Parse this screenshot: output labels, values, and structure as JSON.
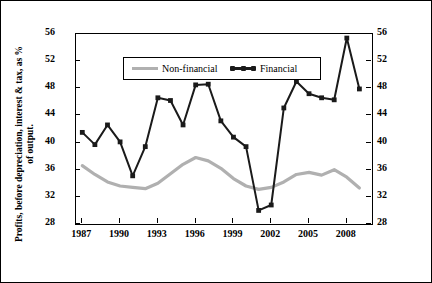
{
  "chart_data": {
    "type": "line",
    "title": "",
    "xlabel": "",
    "ylabel": "Profits, before depreciation, interest & tax, as % of output.",
    "ylim": [
      28,
      56
    ],
    "yticks": [
      28,
      32,
      36,
      40,
      44,
      48,
      52,
      56
    ],
    "xlim": [
      1986.5,
      2010.0
    ],
    "xticks": [
      1987,
      1990,
      1993,
      1996,
      1999,
      2002,
      2005,
      2008
    ],
    "grid": false,
    "legend_position": "top-center",
    "x": [
      1987,
      1988,
      1989,
      1990,
      1991,
      1992,
      1993,
      1994,
      1995,
      1996,
      1997,
      1998,
      1999,
      2000,
      2001,
      2002,
      2003,
      2004,
      2005,
      2006,
      2007,
      2008,
      2009
    ],
    "series": [
      {
        "name": "Non-financial",
        "color": "#b0b0b0",
        "values": [
          36.6,
          35.3,
          34.2,
          33.6,
          33.4,
          33.2,
          34.0,
          35.4,
          36.8,
          37.8,
          37.3,
          36.2,
          34.7,
          33.6,
          33.1,
          33.4,
          34.2,
          35.3,
          35.6,
          35.2,
          36.0,
          34.9,
          33.3
        ]
      },
      {
        "name": "Financial",
        "color": "#1a1a1a",
        "values": [
          41.5,
          39.7,
          42.6,
          40.1,
          35.1,
          39.4,
          46.6,
          46.2,
          42.6,
          48.5,
          48.6,
          43.2,
          40.8,
          39.4,
          30.0,
          30.8,
          45.1,
          49.0,
          47.2,
          46.6,
          46.3,
          55.4,
          47.9
        ]
      }
    ]
  },
  "legend": {
    "items": [
      {
        "label": "Non-financial"
      },
      {
        "label": "Financial"
      }
    ]
  },
  "axis_labels": {
    "y_left": [
      "56",
      "52",
      "48",
      "44",
      "40",
      "36",
      "32",
      "28"
    ],
    "y_right": [
      "56",
      "52",
      "48",
      "44",
      "40",
      "36",
      "32",
      "28"
    ],
    "x": [
      "1987",
      "1990",
      "1993",
      "1996",
      "1999",
      "2002",
      "2005",
      "2008"
    ]
  }
}
